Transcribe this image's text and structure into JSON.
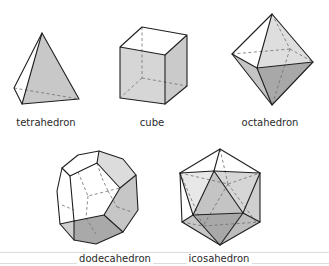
{
  "figure": {
    "shapes": [
      {
        "id": "tetrahedron",
        "label": "tetrahedron"
      },
      {
        "id": "cube",
        "label": "cube"
      },
      {
        "id": "octahedron",
        "label": "octahedron"
      },
      {
        "id": "dodecahedron",
        "label": "dodecahedron"
      },
      {
        "id": "icosahedron",
        "label": "icosahedron"
      }
    ],
    "colors": {
      "face_light": "#e4e4e4",
      "face_mid": "#c9c9c9",
      "face_dark": "#a9a9a9",
      "edge": "#1f1f1f",
      "hidden_edge": "#6e6e6e"
    }
  }
}
